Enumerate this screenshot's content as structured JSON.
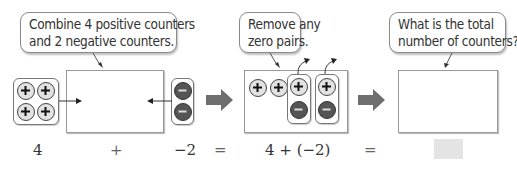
{
  "callouts": {
    "combine": {
      "lines": [
        "Combine 4 positive counters",
        "and 2 negative counters."
      ]
    },
    "remove": {
      "lines": [
        "Remove any",
        "zero pairs."
      ]
    },
    "total": {
      "lines": [
        "What is the total",
        "number of counters?"
      ]
    }
  },
  "counters": {
    "positive_symbol": "+",
    "negative_symbol": "−",
    "positive_color": "#e2e2e2",
    "negative_color": "#555555",
    "initial_positive_count": 4,
    "initial_negative_count": 2,
    "zero_pairs": 2
  },
  "equation": {
    "term1": "4",
    "plus": "+",
    "term2": "−2",
    "equals1": "=",
    "expression": "4 + (−2)",
    "equals2": "=",
    "answer": ""
  },
  "colors": {
    "thick_arrow": "#6e6e6e",
    "answer_box": "#e4e4e4"
  }
}
